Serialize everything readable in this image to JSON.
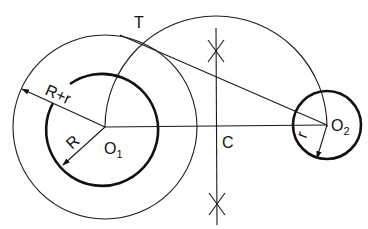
{
  "diagram": {
    "labels": {
      "tangent_point": "T",
      "outer_radius": "R+r",
      "inner_radius": "R",
      "small_radius": "r",
      "center1_main": "O",
      "center1_sub": "1",
      "center2_main": "O",
      "center2_sub": "2",
      "midpoint": "C"
    },
    "geometry": {
      "O1": [
        105,
        127
      ],
      "O2": [
        327,
        125
      ],
      "C": [
        216,
        127
      ],
      "T": [
        142,
        45
      ],
      "radius_R": 56,
      "radius_R_plus_r": 92,
      "radius_r": 34,
      "semicircle_radius": 111
    },
    "colors": {
      "stroke": "#111111",
      "background": "#ffffff"
    }
  }
}
